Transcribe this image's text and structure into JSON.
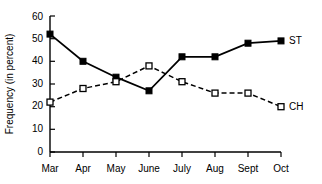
{
  "chart_data": {
    "type": "line",
    "title": "",
    "xlabel": "",
    "ylabel": "Frequency (in percent)",
    "categories": [
      "Mar",
      "Apr",
      "May",
      "June",
      "July",
      "Aug",
      "Sept",
      "Oct"
    ],
    "ylim": [
      0,
      60
    ],
    "yticks": [
      0,
      10,
      20,
      30,
      40,
      50,
      60
    ],
    "grid": false,
    "legend_position": "line-end-right",
    "series": [
      {
        "name": "ST",
        "label": "ST",
        "values": [
          52,
          40,
          33,
          27,
          42,
          42,
          48,
          49
        ],
        "marker": "filled-square",
        "line_style": "solid",
        "color": "#000000"
      },
      {
        "name": "CH",
        "label": "CH",
        "values": [
          22,
          28,
          31,
          38,
          31,
          26,
          26,
          20
        ],
        "marker": "open-square",
        "line_style": "dashed",
        "color": "#000000"
      }
    ]
  },
  "axis": {
    "y_tick_labels": [
      "0",
      "10",
      "20",
      "30",
      "40",
      "50",
      "60"
    ],
    "x_tick_labels": [
      "Mar",
      "Apr",
      "May",
      "June",
      "July",
      "Aug",
      "Sept",
      "Oct"
    ],
    "y_axis_title": "Frequency (in percent)"
  }
}
